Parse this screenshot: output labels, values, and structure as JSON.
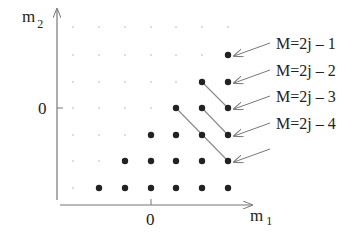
{
  "axes": {
    "x_label": "m",
    "x_label_sub": "1",
    "y_label": "m",
    "y_label_sub": "2",
    "x_zero_label": "0",
    "y_zero_label": "0"
  },
  "grid": {
    "columns_px": [
      73,
      99,
      125,
      151,
      176,
      202,
      228
    ],
    "rows_px": [
      27,
      55,
      82,
      108,
      135,
      161,
      188
    ],
    "zero_column_index": 3,
    "zero_row_index": 3
  },
  "filled_points": [
    [
      6,
      1
    ],
    [
      5,
      2
    ],
    [
      6,
      2
    ],
    [
      4,
      3
    ],
    [
      5,
      3
    ],
    [
      6,
      3
    ],
    [
      3,
      4
    ],
    [
      4,
      4
    ],
    [
      5,
      4
    ],
    [
      6,
      4
    ],
    [
      2,
      5
    ],
    [
      3,
      5
    ],
    [
      4,
      5
    ],
    [
      5,
      5
    ],
    [
      6,
      5
    ],
    [
      1,
      6
    ],
    [
      2,
      6
    ],
    [
      3,
      6
    ],
    [
      4,
      6
    ],
    [
      5,
      6
    ],
    [
      6,
      6
    ]
  ],
  "diagonal_lines": [
    [
      [
        5,
        2
      ],
      [
        6,
        3
      ]
    ],
    [
      [
        5,
        3
      ],
      [
        6,
        4
      ]
    ],
    [
      [
        4,
        3
      ],
      [
        6,
        5
      ]
    ]
  ],
  "labels": [
    {
      "text": "M=2j – 1",
      "target": [
        6,
        1
      ]
    },
    {
      "text": "M=2j – 2",
      "target": [
        6,
        2
      ]
    },
    {
      "text": "M=2j – 3",
      "target": [
        6,
        3
      ]
    },
    {
      "text": "M=2j – 4",
      "target": [
        6,
        4
      ]
    },
    {
      "text": "",
      "target": [
        6,
        5
      ]
    }
  ],
  "colors": {
    "dot": "#222222",
    "faint_dot": "#b0b0b0",
    "axis": "#777777",
    "line": "#888888",
    "text": "#222222"
  }
}
